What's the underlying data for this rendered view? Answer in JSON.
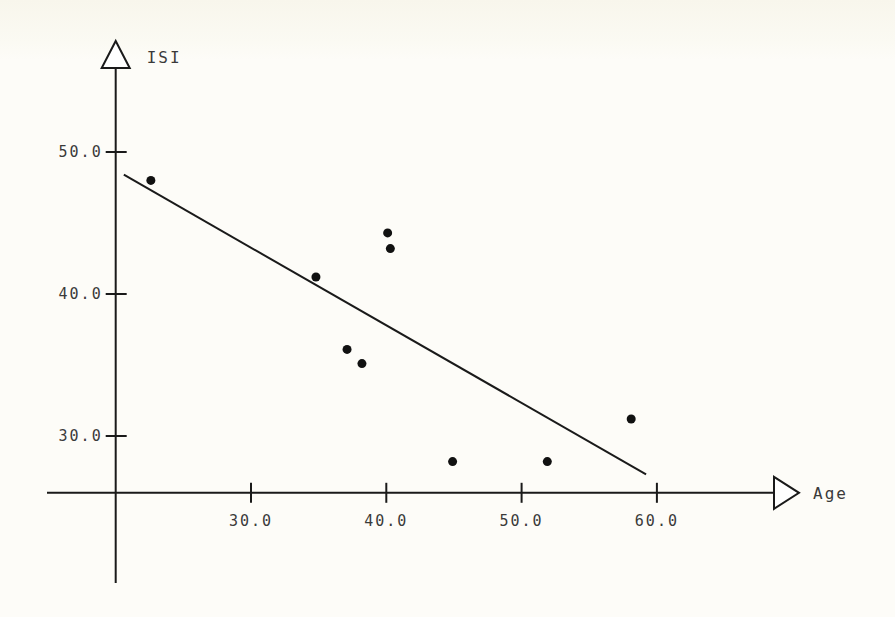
{
  "chart_data": {
    "type": "scatter",
    "title": "",
    "xlabel": "Age",
    "ylabel": "ISI",
    "x_axis_origin": 20,
    "y_axis_origin": 26,
    "xlim": [
      20,
      70
    ],
    "ylim": [
      26,
      54
    ],
    "x_ticks": [
      {
        "value": 30,
        "label": "30.0"
      },
      {
        "value": 40,
        "label": "40.0"
      },
      {
        "value": 50,
        "label": "50.0"
      },
      {
        "value": 60,
        "label": "60.0"
      }
    ],
    "y_ticks": [
      {
        "value": 30,
        "label": "30.0"
      },
      {
        "value": 40,
        "label": "40.0"
      },
      {
        "value": 50,
        "label": "50.0"
      }
    ],
    "grid": false,
    "legend": "none",
    "series": [
      {
        "name": "observations",
        "points": [
          {
            "x": 22.6,
            "y": 48.0
          },
          {
            "x": 34.8,
            "y": 41.2
          },
          {
            "x": 37.1,
            "y": 36.1
          },
          {
            "x": 38.2,
            "y": 35.1
          },
          {
            "x": 40.1,
            "y": 44.3
          },
          {
            "x": 40.3,
            "y": 43.2
          },
          {
            "x": 44.9,
            "y": 28.2
          },
          {
            "x": 51.9,
            "y": 28.2
          },
          {
            "x": 58.1,
            "y": 31.2
          }
        ]
      }
    ],
    "regression_line": {
      "start": {
        "x": 20.6,
        "y": 48.4
      },
      "end": {
        "x": 59.2,
        "y": 27.3
      }
    }
  }
}
